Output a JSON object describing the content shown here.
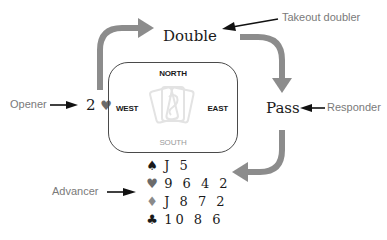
{
  "auction": {
    "opener_bid": {
      "level": "2",
      "suit_symbol": "♥"
    },
    "overcall": "Double",
    "responder_bid": "Pass"
  },
  "roles": {
    "opener": "Opener",
    "takeout_doubler": "Takeout doubler",
    "responder": "Responder",
    "advancer": "Advancer"
  },
  "table": {
    "north": "NORTH",
    "south": "SOUTH",
    "east": "EAST",
    "west": "WEST",
    "center_icon": "playing-cards-icon"
  },
  "hand": [
    {
      "suit": "spades",
      "symbol": "♠",
      "cards": "J 5",
      "color": "#1a1a1a"
    },
    {
      "suit": "hearts",
      "symbol": "♥",
      "cards": "9 6 4 2",
      "color": "#6b6b6b"
    },
    {
      "suit": "diamonds",
      "symbol": "♦",
      "cards": "J 8 7 2",
      "color": "#8a8a8a"
    },
    {
      "suit": "clubs",
      "symbol": "♣",
      "cards": "10 8 6",
      "color": "#1a1a1a"
    }
  ],
  "colors": {
    "flow_arrow": "#8c8c8c",
    "pointer_arrow": "#111111",
    "label_text": "#7a7a7a"
  }
}
